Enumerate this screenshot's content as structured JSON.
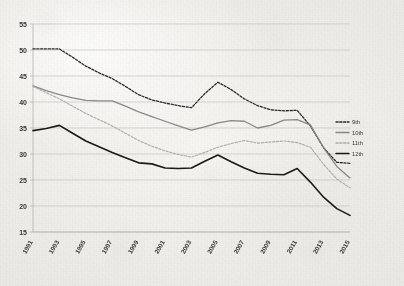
{
  "chart_data": {
    "type": "line",
    "title": "",
    "subtitle": "",
    "xlabel": "",
    "ylabel": "",
    "xlim": [
      1991,
      2015
    ],
    "ylim": [
      15,
      55
    ],
    "grid": "horizontal",
    "legend_position": "center-right-inside",
    "x": [
      1991,
      1992,
      1993,
      1994,
      1995,
      1996,
      1997,
      1998,
      1999,
      2000,
      2001,
      2002,
      2003,
      2004,
      2005,
      2006,
      2007,
      2008,
      2009,
      2010,
      2011,
      2012,
      2013,
      2014,
      2015
    ],
    "xtick_labels": [
      "1991",
      "1993",
      "1995",
      "1997",
      "1999",
      "2001",
      "2003",
      "2005",
      "2007",
      "2009",
      "2011",
      "2013",
      "2015"
    ],
    "xtick_values": [
      1991,
      1993,
      1995,
      1997,
      1999,
      2001,
      2003,
      2005,
      2007,
      2009,
      2011,
      2013,
      2015
    ],
    "ytick_labels": [
      "15",
      "20",
      "25",
      "30",
      "35",
      "40",
      "45",
      "50",
      "55"
    ],
    "ytick_values": [
      15,
      20,
      25,
      30,
      35,
      40,
      45,
      50,
      55
    ],
    "series": [
      {
        "name": "9th",
        "color": "#2b2b2b",
        "style": "dashed",
        "width": 1.3,
        "values": [
          50.2,
          50.2,
          50.2,
          48.6,
          46.9,
          45.6,
          44.5,
          43.0,
          41.4,
          40.4,
          39.8,
          39.3,
          38.9,
          41.6,
          43.8,
          42.4,
          40.6,
          39.3,
          38.5,
          38.3,
          38.4,
          35.4,
          31.2,
          28.4,
          28.2
        ]
      },
      {
        "name": "10th",
        "color": "#8a8a8a",
        "style": "solid",
        "width": 1.3,
        "values": [
          43.1,
          42.2,
          41.4,
          40.8,
          40.3,
          40.2,
          40.2,
          39.2,
          38.1,
          37.2,
          36.3,
          35.4,
          34.6,
          35.2,
          36.0,
          36.4,
          36.3,
          35.0,
          35.5,
          36.5,
          36.6,
          35.6,
          31.2,
          27.6,
          25.4
        ]
      },
      {
        "name": "11th",
        "color": "#b0b0b0",
        "style": "dashed",
        "width": 1.2,
        "values": [
          43.0,
          41.8,
          40.6,
          39.2,
          37.8,
          36.6,
          35.4,
          34.0,
          32.6,
          31.5,
          30.6,
          29.9,
          29.4,
          30.3,
          31.3,
          32.0,
          32.6,
          32.1,
          32.3,
          32.5,
          32.2,
          31.3,
          28.0,
          25.2,
          23.5
        ]
      },
      {
        "name": "12th",
        "color": "#1a1a1a",
        "style": "solid",
        "width": 1.6,
        "values": [
          34.5,
          34.9,
          35.5,
          34.0,
          32.5,
          31.4,
          30.3,
          29.3,
          28.3,
          28.1,
          27.3,
          27.2,
          27.3,
          28.6,
          29.8,
          28.5,
          27.3,
          26.3,
          26.1,
          26.0,
          27.2,
          24.6,
          21.7,
          19.5,
          18.2
        ]
      }
    ],
    "legend": [
      {
        "label": "9th",
        "color": "#2b2b2b",
        "style": "dashed"
      },
      {
        "label": "10th",
        "color": "#8a8a8a",
        "style": "solid"
      },
      {
        "label": "11th",
        "color": "#b0b0b0",
        "style": "dashed"
      },
      {
        "label": "12th",
        "color": "#1a1a1a",
        "style": "solid"
      }
    ]
  }
}
